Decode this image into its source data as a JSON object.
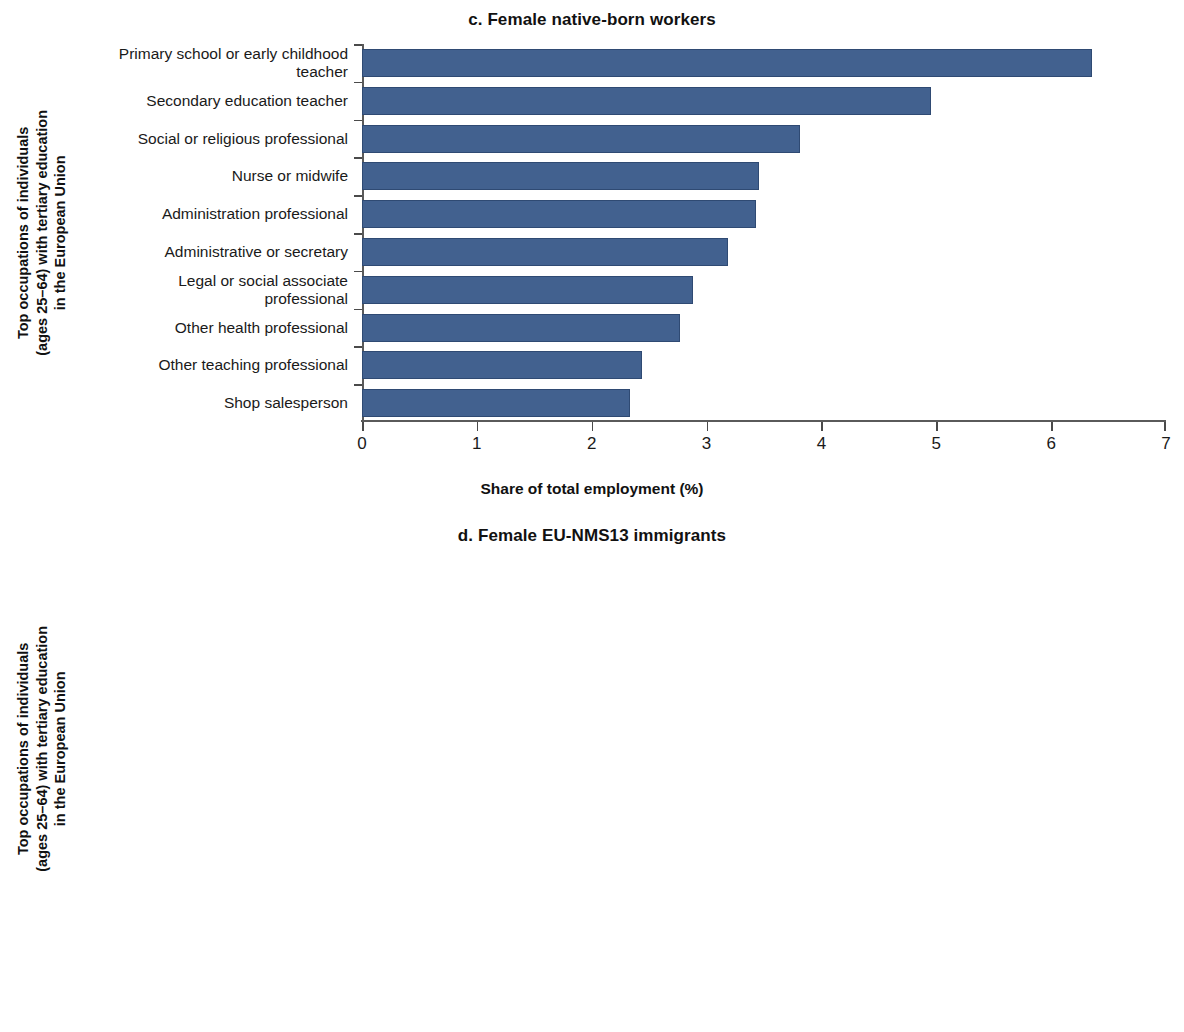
{
  "figure": {
    "bar_color": "#42618f",
    "axis_color": "#5a5a5a"
  },
  "panels": [
    {
      "id": "panel-top",
      "title": "c. Female native-born workers",
      "ylabel_lines": [
        "Top occupations of individuals",
        "(ages 25–64) with tertiary education",
        "in the European Union"
      ],
      "xlabel": "Share of total employment (%)",
      "xticks": [
        "0",
        "1",
        "2",
        "3",
        "4",
        "5",
        "6",
        "7"
      ],
      "categories": [
        "Primary school or early childhood teacher",
        "Secondary education teacher",
        "Social or religious professional",
        "Nurse or midwife",
        "Administration professional",
        "Administrative or secretary",
        "Legal or social associate professional",
        "Other health professional",
        "Other teaching professional",
        "Shop salesperson"
      ],
      "values": [
        6.36,
        4.95,
        3.81,
        3.46,
        3.43,
        3.19,
        2.88,
        2.77,
        2.44,
        2.33
      ]
    },
    {
      "id": "panel-bottom",
      "title": "d. Female EU-NMS13 immigrants",
      "ylabel_lines": [
        "Top occupations of individuals",
        "(ages 25–64) with tertiary education",
        "in the European Union"
      ],
      "xlabel": "Share of total employment (%)",
      "xticks": [
        "0",
        "1",
        "2",
        "3",
        "4",
        "5",
        "6",
        "7",
        "8"
      ],
      "categories": [
        "Cleaner or helper",
        "Personal care worker",
        "Shop salesperson",
        "Medical doctor",
        "Administration professional",
        "Clerical support",
        "Waiter or bartender",
        "Administrative or secretary",
        "Nurse associate",
        "Legal or social associate"
      ],
      "values": [
        7.9,
        4.31,
        3.88,
        3.78,
        3.0,
        2.75,
        2.7,
        2.46,
        2.3,
        2.13
      ]
    }
  ],
  "chart_data": [
    {
      "type": "bar",
      "orientation": "horizontal",
      "title": "c. Female native-born workers",
      "xlabel": "Share of total employment (%)",
      "ylabel": "Top occupations of individuals (ages 25–64) with tertiary education in the European Union",
      "xlim": [
        0,
        7
      ],
      "xticks": [
        0,
        1,
        2,
        3,
        4,
        5,
        6,
        7
      ],
      "grid": false,
      "legend": null,
      "bar_color": "#42618f",
      "categories": [
        "Primary school or early childhood teacher",
        "Secondary education teacher",
        "Social or religious professional",
        "Nurse or midwife",
        "Administration professional",
        "Administrative or secretary",
        "Legal or social associate professional",
        "Other health professional",
        "Other teaching professional",
        "Shop salesperson"
      ],
      "values": [
        6.36,
        4.95,
        3.81,
        3.46,
        3.43,
        3.19,
        2.88,
        2.77,
        2.44,
        2.33
      ]
    },
    {
      "type": "bar",
      "orientation": "horizontal",
      "title": "d. Female EU-NMS13 immigrants",
      "xlabel": "Share of total employment (%)",
      "ylabel": "Top occupations of individuals (ages 25–64) with tertiary education in the European Union",
      "xlim": [
        0,
        8
      ],
      "xticks": [
        0,
        1,
        2,
        3,
        4,
        5,
        6,
        7,
        8
      ],
      "grid": false,
      "legend": null,
      "bar_color": "#42618f",
      "categories": [
        "Cleaner or helper",
        "Personal care worker",
        "Shop salesperson",
        "Medical doctor",
        "Administration professional",
        "Clerical support",
        "Waiter or bartender",
        "Administrative or secretary",
        "Nurse associate",
        "Legal or social associate"
      ],
      "values": [
        7.9,
        4.31,
        3.88,
        3.78,
        3.0,
        2.75,
        2.7,
        2.46,
        2.3,
        2.13
      ]
    }
  ]
}
